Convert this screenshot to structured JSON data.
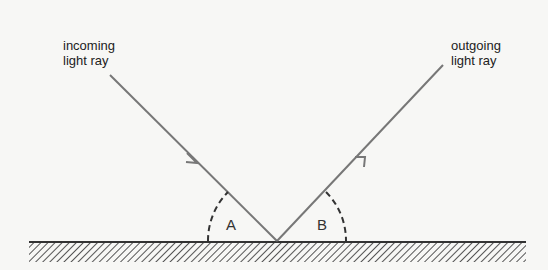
{
  "diagram": {
    "incoming": {
      "line1": "incoming",
      "line2": "light ray"
    },
    "outgoing": {
      "line1": "outgoing",
      "line2": "light ray"
    },
    "angles": {
      "a": "A",
      "b": "B"
    },
    "colors": {
      "ray": "#777777",
      "surface": "#333333",
      "hatch": "#666666",
      "arc": "#333333"
    }
  }
}
